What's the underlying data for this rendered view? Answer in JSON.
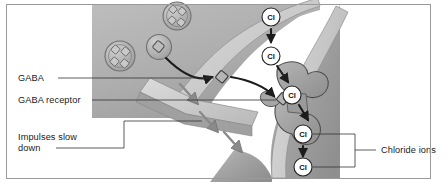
{
  "figure": {
    "background_color": "#ffffff",
    "frame_color": "#9a9a9a"
  },
  "labels": [
    {
      "id": "gaba",
      "text": "GABA",
      "x": 18,
      "y": 81,
      "leader": "M 58 78 L 222 78"
    },
    {
      "id": "gaba-receptor",
      "text": "GABA receptor",
      "x": 18,
      "y": 104,
      "leader": "M 90 100 L 282 100"
    },
    {
      "id": "impulses-slow-down-line1",
      "text": "Impulses slow",
      "x": 18,
      "y": 140,
      "leader": ""
    },
    {
      "id": "impulses-slow-down-line2",
      "text": "down",
      "x": 18,
      "y": 151,
      "leader": "M 56 148 L 124 148 L 124 121 L 200 121"
    },
    {
      "id": "chloride-ions",
      "text": "Chloride ions",
      "x": 388,
      "y": 152,
      "leader": "M 355 149 L 375 149"
    }
  ],
  "ions": [
    {
      "id": "cl-1",
      "label": "Cl",
      "cx": 271,
      "cy": 17,
      "r": 9
    },
    {
      "id": "cl-2",
      "label": "Cl",
      "cx": 271,
      "cy": 56,
      "r": 9
    },
    {
      "id": "cl-3",
      "label": "Cl",
      "cx": 292,
      "cy": 95,
      "r": 9
    },
    {
      "id": "cl-4",
      "label": "Cl",
      "cx": 303,
      "cy": 134,
      "r": 9
    },
    {
      "id": "cl-5",
      "label": "Cl",
      "cx": 303,
      "cy": 167,
      "r": 9
    }
  ],
  "ion_arrows": [
    {
      "id": "ion-arrow-top",
      "path": "M 271 28 L 271 44"
    },
    {
      "id": "ion-arrow-into-channel",
      "path": "M 277 66 L 289 84"
    },
    {
      "id": "ion-arrow-out-channel",
      "path": "M 300 106 L 309 122"
    },
    {
      "id": "ion-arrow-bottom",
      "path": "M 303 145 L 303 157"
    }
  ],
  "bracket": {
    "id": "chloride-bracket",
    "path": "M 314 134 L 355 134 L 355 167 L 314 167",
    "mid_tick": "M 355 149 L 375 149"
  },
  "gaba_molecules": [
    {
      "id": "gaba-molecule-cleft",
      "cx": 222,
      "cy": 77,
      "size": 8
    },
    {
      "id": "gaba-molecule-bound",
      "cx": 283,
      "cy": 99,
      "size": 8
    },
    {
      "id": "gaba-molecule-vesicle-release",
      "cx": 160,
      "cy": 50,
      "size": 8
    }
  ],
  "release_arrows": [
    {
      "id": "release-arrow-1",
      "path": "M 166 58 Q 190 82 215 77"
    },
    {
      "id": "release-arrow-2",
      "path": "M 230 76 Q 258 82 276 98"
    }
  ],
  "impulse_arrows": [
    {
      "id": "impulse-arrow-1",
      "path": "M 181 85 L 199 106"
    },
    {
      "id": "impulse-arrow-2",
      "path": "M 201 113 L 219 134"
    },
    {
      "id": "impulse-arrow-3",
      "path": "M 224 133 L 243 154"
    }
  ],
  "vesicles": [
    {
      "id": "vesicle-1",
      "cx": 177,
      "cy": 16,
      "r": 14
    },
    {
      "id": "vesicle-2",
      "cx": 120,
      "cy": 56,
      "r": 15
    },
    {
      "id": "vesicle-docked",
      "cx": 159,
      "cy": 47,
      "r": 12
    }
  ],
  "cells": {
    "presynaptic": {
      "id": "presynaptic-neuron",
      "fill": "#b2b2b2",
      "membrane_fill": "#cfcfcf",
      "label": "presynaptic terminal"
    },
    "postsynaptic": {
      "id": "postsynaptic-neuron",
      "fill": "#a5a5a5",
      "membrane_fill": "#cccccc",
      "label": "postsynaptic neuron"
    },
    "cleft": {
      "id": "synaptic-cleft",
      "fill": "#ffffff",
      "label": "synaptic cleft"
    }
  },
  "receptor": {
    "id": "gaba-receptor-channel",
    "fill": "#9e9e9e",
    "stroke": "#4a4a4a",
    "label": "GABA receptor chloride channel"
  },
  "colors": {
    "text": "#1a1a1a",
    "leader": "#333333",
    "arrow_dark": "#1c1c1c",
    "arrow_gray": "#7d7d7d",
    "ion_circle_stroke": "#222222",
    "ion_circle_fill": "#ffffff"
  }
}
